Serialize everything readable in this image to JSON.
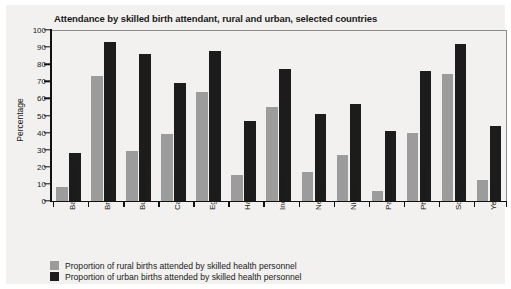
{
  "chart_data": {
    "type": "bar",
    "title": "Attendance by skilled birth attendant, rural and urban, selected countries",
    "xlabel": "",
    "ylabel": "Percentage",
    "ylim": [
      0,
      100
    ],
    "ytick_step": 10,
    "yticks": [
      "100",
      "90",
      "80",
      "70",
      "60",
      "50",
      "40",
      "30",
      "20",
      "10",
      "0"
    ],
    "grid": false,
    "legend_position": "bottom-left",
    "categories": [
      "Bangladesh",
      "Brazil",
      "Burkina Faso",
      "Cambodia",
      "Egypt",
      "Haiti",
      "Indonesia",
      "Nepal",
      "Nigeria",
      "Pakistan",
      "Philippines",
      "South Africa",
      "Yemen"
    ],
    "series": [
      {
        "name": "Proportion of rural births attended by skilled health personnel",
        "key": "rural",
        "color": "#9c9c9c",
        "values": [
          8,
          73,
          29,
          39,
          64,
          15,
          55,
          17,
          27,
          6,
          40,
          74,
          12
        ]
      },
      {
        "name": "Proportion of urban births attended by skilled health personnel",
        "key": "urban",
        "color": "#1c1c1c",
        "values": [
          28,
          93,
          86,
          69,
          88,
          47,
          77,
          51,
          57,
          41,
          76,
          92,
          44
        ]
      }
    ]
  },
  "colors": {
    "rural": "#9c9c9c",
    "urban": "#1c1c1c",
    "axis": "#111111",
    "background": "#f2f1ef"
  }
}
